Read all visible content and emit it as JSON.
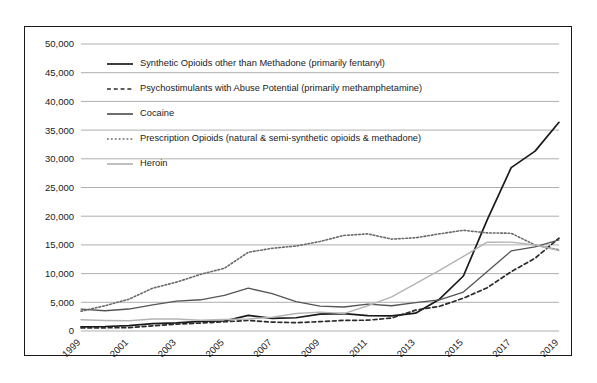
{
  "clipped_caption_top": "",
  "chart_data": {
    "type": "line",
    "title": "",
    "xlabel": "",
    "ylabel": "",
    "grid": "horizontal",
    "legend_position": "inside-top-left",
    "x": [
      1999,
      2000,
      2001,
      2002,
      2003,
      2004,
      2005,
      2006,
      2007,
      2008,
      2009,
      2010,
      2011,
      2012,
      2013,
      2014,
      2015,
      2016,
      2017,
      2018,
      2019
    ],
    "xtick_labels": [
      "1999",
      "2001",
      "2003",
      "2005",
      "2007",
      "2009",
      "2011",
      "2013",
      "2015",
      "2017",
      "2019"
    ],
    "xlim": [
      1999,
      2019
    ],
    "ylim": [
      0,
      50000
    ],
    "ytick_labels": [
      "0",
      "5,000",
      "10,000",
      "15,000",
      "20,000",
      "25,000",
      "30,000",
      "35,000",
      "40,000",
      "45,000",
      "50,000"
    ],
    "ytick_values": [
      0,
      5000,
      10000,
      15000,
      20000,
      25000,
      30000,
      35000,
      40000,
      45000,
      50000
    ],
    "series": [
      {
        "name": "Synthetic Opioids other than Methadone (primarily fentanyl)",
        "style": "solid",
        "color": "#1a1a1a",
        "width": 1.7,
        "values": [
          730,
          780,
          950,
          1300,
          1400,
          1660,
          1740,
          2710,
          2210,
          2310,
          2950,
          3010,
          2670,
          2630,
          3110,
          5540,
          9580,
          19410,
          28470,
          31340,
          36360
        ]
      },
      {
        "name": "Psychostimulants with Abuse Potential (primarily methamphetamine)",
        "style": "dashed",
        "color": "#2b2b2b",
        "width": 1.7,
        "values": [
          550,
          560,
          580,
          910,
          1190,
          1380,
          1610,
          1830,
          1550,
          1450,
          1630,
          1850,
          1880,
          2260,
          3630,
          4300,
          5720,
          7540,
          10330,
          12680,
          16170
        ]
      },
      {
        "name": "Cocaine",
        "style": "solid",
        "color": "#555555",
        "width": 1.3,
        "values": [
          3820,
          3530,
          3830,
          4570,
          5200,
          5440,
          6210,
          7450,
          6510,
          5130,
          4350,
          4180,
          4680,
          4400,
          4940,
          5420,
          6780,
          10370,
          13940,
          14670,
          15880
        ]
      },
      {
        "name": "Prescription Opioids (natural & semi-synthetic opioids & methadone)",
        "style": "dotted",
        "color": "#6a6a6a",
        "width": 1.6,
        "values": [
          3440,
          4400,
          5530,
          7460,
          8520,
          9860,
          10930,
          13720,
          14410,
          14800,
          15600,
          16650,
          16920,
          16010,
          16240,
          16930,
          17540,
          17090,
          17030,
          14980,
          14140
        ]
      },
      {
        "name": "Heroin",
        "style": "solid",
        "color": "#b4b4b4",
        "width": 1.4,
        "values": [
          1960,
          1840,
          1780,
          2090,
          2080,
          1880,
          2010,
          2090,
          2400,
          3040,
          3280,
          3040,
          4400,
          5930,
          8260,
          10570,
          12990,
          15470,
          15480,
          14990,
          14020
        ]
      }
    ]
  },
  "legend": {
    "items": [
      {
        "label": "Synthetic Opioids other than Methadone (primarily fentanyl)",
        "style": "solid",
        "color": "#1a1a1a"
      },
      {
        "label": "Psychostimulants with Abuse Potential (primarily methamphetamine)",
        "style": "dashed",
        "color": "#2b2b2b"
      },
      {
        "label": "Cocaine",
        "style": "solid",
        "color": "#555555"
      },
      {
        "label": "Prescription Opioids (natural & semi-synthetic opioids & methadone)",
        "style": "dotted",
        "color": "#6a6a6a"
      },
      {
        "label": "Heroin",
        "style": "solid",
        "color": "#b4b4b4"
      }
    ]
  }
}
